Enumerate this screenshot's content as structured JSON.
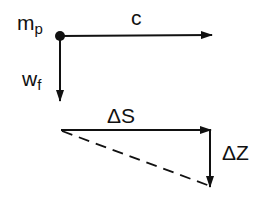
{
  "diagram": {
    "labels": {
      "mass": "m",
      "mass_sub": "p",
      "velocity": "c",
      "fall": "w",
      "fall_sub": "f",
      "horizontal": "ΔS",
      "vertical": "ΔZ"
    },
    "colors": {
      "stroke": "#111111",
      "background": "#ffffff"
    }
  }
}
